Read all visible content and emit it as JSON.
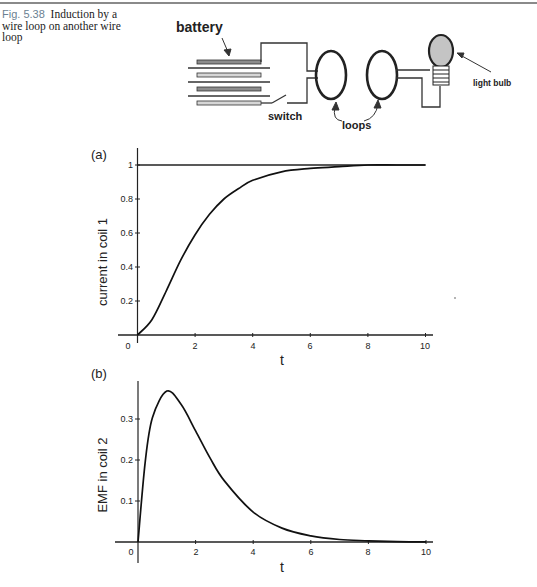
{
  "caption": {
    "figure_number": "Fig. 5.38",
    "text": "Induction by a wire loop on another wire loop"
  },
  "diagram": {
    "labels": {
      "battery": "battery",
      "switch": "switch",
      "loops": "loops",
      "light_bulb": "light bulb"
    }
  },
  "panels": {
    "a": {
      "label": "(a)",
      "ylabel": "current in coil 1",
      "xlabel": "t"
    },
    "b": {
      "label": "(b)",
      "ylabel": "EMF in coil 2",
      "xlabel": "t"
    }
  },
  "chart_data": [
    {
      "type": "line",
      "title": "(a)",
      "xlabel": "t",
      "ylabel": "current in coil 1",
      "xlim": [
        0,
        10
      ],
      "ylim": [
        0,
        1.05
      ],
      "xticks": [
        0,
        2,
        4,
        6,
        8,
        10
      ],
      "yticks": [
        0.2,
        0.4,
        0.6,
        0.8,
        1
      ],
      "grid": false,
      "series": [
        {
          "name": "current in coil 1",
          "x": [
            0,
            0.5,
            1,
            1.5,
            2,
            2.5,
            3,
            3.5,
            4,
            5,
            6,
            7,
            8,
            9,
            10
          ],
          "y": [
            0,
            0.09,
            0.26,
            0.44,
            0.59,
            0.71,
            0.8,
            0.86,
            0.91,
            0.96,
            0.98,
            0.99,
            1.0,
            1.0,
            1.0
          ]
        },
        {
          "name": "asymptote y=1",
          "x": [
            0,
            10
          ],
          "y": [
            1,
            1
          ]
        }
      ]
    },
    {
      "type": "line",
      "title": "(b)",
      "xlabel": "t",
      "ylabel": "EMF in coil 2",
      "xlim": [
        0,
        10
      ],
      "ylim": [
        0,
        0.39
      ],
      "xticks": [
        0,
        2,
        4,
        6,
        8,
        10
      ],
      "yticks": [
        0.1,
        0.2,
        0.3
      ],
      "grid": false,
      "series": [
        {
          "name": "EMF in coil 2",
          "x": [
            0,
            0.25,
            0.5,
            1,
            1.5,
            2,
            2.5,
            3,
            4,
            5,
            6,
            7,
            8,
            9,
            10
          ],
          "y": [
            0,
            0.195,
            0.303,
            0.368,
            0.335,
            0.271,
            0.205,
            0.149,
            0.073,
            0.034,
            0.015,
            0.006,
            0.003,
            0.001,
            0.0005
          ]
        }
      ]
    }
  ]
}
